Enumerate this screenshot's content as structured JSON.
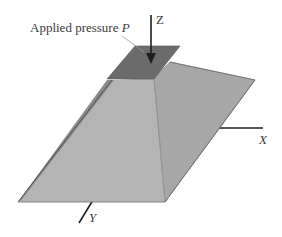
{
  "figure": {
    "type": "3d-schematic",
    "labels": {
      "pressure_text": "Applied pressure ",
      "pressure_symbol": "P",
      "axis_z": "Z",
      "axis_x": "X",
      "axis_y": "Y"
    },
    "colors": {
      "background": "#ffffff",
      "top_plate": "#6b6b6b",
      "left_face": "#b4b4b4",
      "right_face": "#a6a6a6",
      "left_edge_shadow": "#8a8a8a",
      "lines": "#1e1e1e",
      "leader_line": "#9a9a9a",
      "text": "#3a3a3a"
    },
    "elements": [
      "top-plate",
      "pressure-arrow",
      "pyramid-left-face",
      "pyramid-right-face",
      "x-axis",
      "y-axis",
      "z-axis"
    ]
  }
}
